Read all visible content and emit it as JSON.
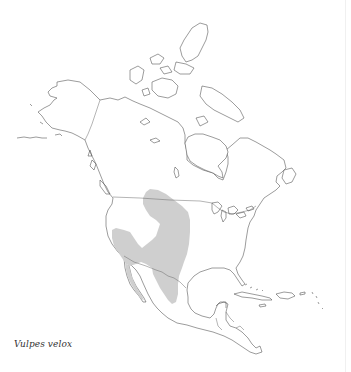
{
  "map": {
    "species_label": "Vulpes velox",
    "region": "North America",
    "range_fill_color": "#cfcfcf",
    "outline_color": "#4a4a4a",
    "background_color": "#ffffff"
  }
}
